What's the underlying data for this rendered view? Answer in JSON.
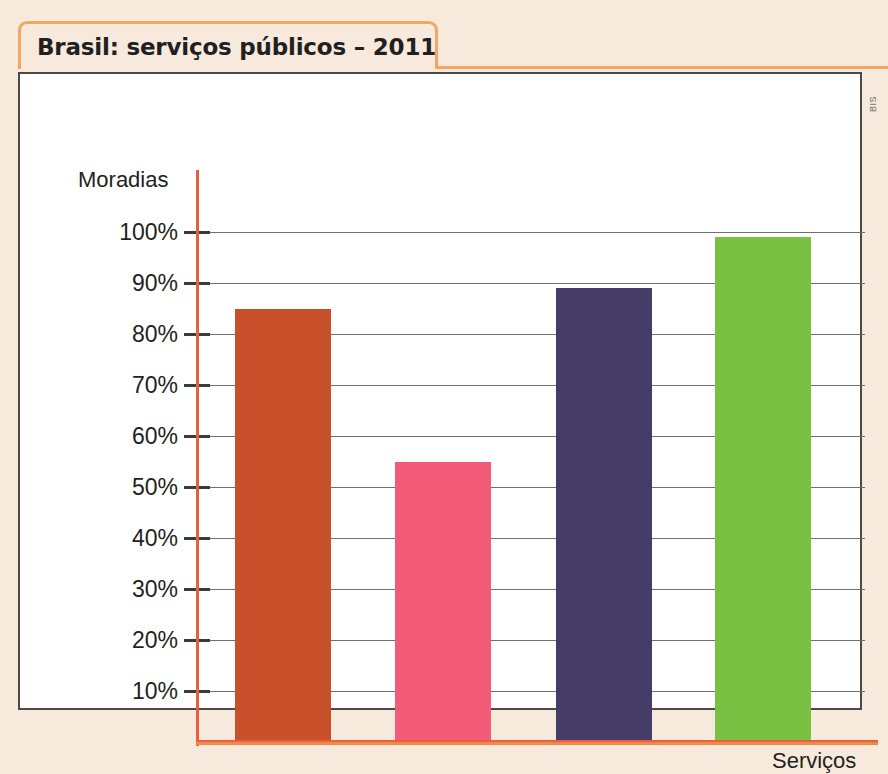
{
  "title": "Brasil: serviços públicos – 2011",
  "credit": "BIS",
  "colors": {
    "page_background": "#f7e9dc",
    "title_border": "#f0a860",
    "panel_border": "#4c4a48",
    "axis": "#e8613c",
    "gridline": "#6f6f6f",
    "text": "#231f20"
  },
  "chart_data": {
    "type": "bar",
    "title": "Brasil: serviços públicos – 2011",
    "xlabel": "Serviços",
    "ylabel": "Moradias",
    "categories": [
      "Serviço 1",
      "Serviço 2",
      "Serviço 3",
      "Serviço 4"
    ],
    "values": [
      85,
      55,
      89,
      99
    ],
    "value_labels": [
      "85%",
      "55%",
      "89%",
      "99%"
    ],
    "bar_colors": [
      "#c8502a",
      "#f25c79",
      "#453d68",
      "#7ac043"
    ],
    "ylim": [
      0,
      105
    ],
    "ytick_values": [
      10,
      20,
      30,
      40,
      50,
      60,
      70,
      80,
      90,
      100
    ],
    "ytick_labels": [
      "10%",
      "20%",
      "30%",
      "40%",
      "50%",
      "60%",
      "70%",
      "80%",
      "90%",
      "100%"
    ],
    "grid": true,
    "legend": "none",
    "xtick_labels": []
  }
}
